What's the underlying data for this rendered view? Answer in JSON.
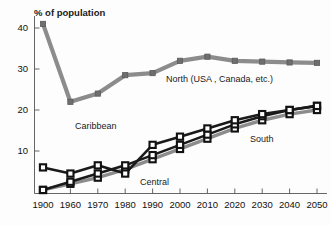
{
  "chart_data": {
    "type": "line",
    "title": "",
    "ylabel": "% of population",
    "xlabel": "",
    "ylim": [
      0,
      44
    ],
    "xlim": [
      0,
      10
    ],
    "grid": false,
    "legend_position": "inline-annotations",
    "categories": [
      "1900",
      "1960",
      "1970",
      "1980",
      "1990",
      "2000",
      "2010",
      "2020",
      "2030",
      "2040",
      "2050"
    ],
    "yticks": [
      "10",
      "20",
      "30",
      "40"
    ],
    "ytick_values": [
      10,
      20,
      30,
      40
    ],
    "series": [
      {
        "name": "North (USA , Canada, etc.)",
        "color": "#8c8c8c",
        "marker": "square",
        "label_x": 166,
        "label_y": 74,
        "values": [
          41,
          22,
          24,
          28.5,
          29,
          32,
          33,
          32,
          31.8,
          31.6,
          31.5
        ]
      },
      {
        "name": "Caribbean",
        "color": "#1a1a1a",
        "marker": "square-open",
        "label_x": 75,
        "label_y": 121,
        "values": [
          6,
          4.5,
          6.5,
          4.5,
          11.5,
          13.5,
          15.5,
          17.5,
          19,
          20,
          21
        ]
      },
      {
        "name": "South",
        "color": "#1a1a1a",
        "marker": "square-open",
        "label_x": 250,
        "label_y": 134,
        "values": [
          0.5,
          2.5,
          4.5,
          6.5,
          9,
          11.5,
          14,
          16.5,
          18.5,
          20,
          21
        ]
      },
      {
        "name": "Central",
        "color": "#8c8c8c",
        "marker": "square-open",
        "label_x": 140,
        "label_y": 177,
        "values": [
          0.5,
          2,
          3.5,
          5.5,
          8,
          10.5,
          13,
          15.5,
          17.5,
          19,
          20
        ]
      }
    ]
  },
  "axis": {
    "y_title": "% of population"
  },
  "colors": {
    "north": "#8c8c8c",
    "caribbean": "#1a1a1a",
    "south": "#1a1a1a",
    "central": "#8c8c8c",
    "axis": "#555555",
    "background": "#fdfdfd"
  }
}
